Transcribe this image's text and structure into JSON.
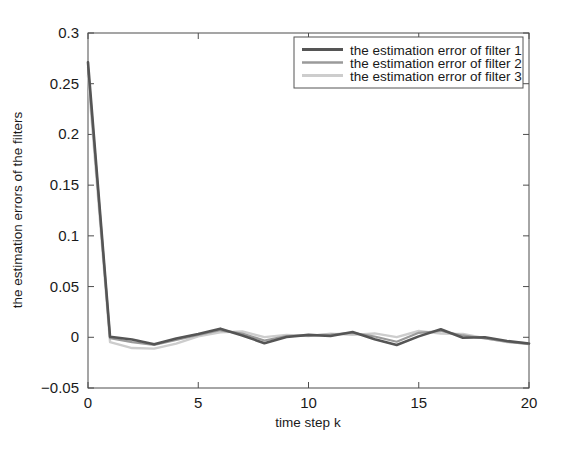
{
  "chart_data": {
    "type": "line",
    "title": "",
    "xlabel": "time step k",
    "ylabel": "the estimation errors of the filters",
    "xlim": [
      0,
      20
    ],
    "ylim": [
      -0.05,
      0.3
    ],
    "xticks": [
      0,
      5,
      10,
      15,
      20
    ],
    "yticks": [
      -0.05,
      0,
      0.05,
      0.1,
      0.15,
      0.2,
      0.25,
      0.3
    ],
    "xtick_labels": [
      "0",
      "5",
      "10",
      "15",
      "20"
    ],
    "ytick_labels": [
      "-0.05",
      "0",
      "0.05",
      "0.1",
      "0.15",
      "0.2",
      "0.25",
      "0.3"
    ],
    "grid": false,
    "legend_position": "top-right",
    "x": [
      0,
      1,
      2,
      3,
      4,
      5,
      6,
      7,
      8,
      9,
      10,
      11,
      12,
      13,
      14,
      15,
      16,
      17,
      18,
      19,
      20
    ],
    "series": [
      {
        "name": "the estimation error of filter 1",
        "color": "#555555",
        "width": 2.6,
        "values": [
          0.271,
          0.0005,
          -0.0022,
          -0.0068,
          -0.0012,
          0.0032,
          0.0085,
          0.0018,
          -0.0058,
          0.0003,
          0.0024,
          0.0012,
          0.0052,
          -0.0019,
          -0.0076,
          0.0009,
          0.0079,
          -0.0004,
          0.0001,
          -0.0037,
          -0.0062
        ]
      },
      {
        "name": "the estimation error of filter 2",
        "color": "#9a9a9a",
        "width": 2.2,
        "values": [
          0.266,
          -0.0008,
          -0.0048,
          -0.0075,
          -0.0026,
          0.0022,
          0.0069,
          0.0036,
          -0.0032,
          0.0012,
          0.0018,
          0.0026,
          0.0044,
          0.0008,
          -0.0044,
          0.0044,
          0.0062,
          0.0018,
          -0.0012,
          -0.0044,
          -0.0068
        ]
      },
      {
        "name": "the estimation error of filter 3",
        "color": "#cdcdcd",
        "width": 2.4,
        "values": [
          0.258,
          -0.0048,
          -0.0106,
          -0.0112,
          -0.0062,
          0.0009,
          0.0048,
          0.0058,
          0.0002,
          0.0024,
          0.0012,
          0.0036,
          0.0024,
          0.0038,
          0.0002,
          0.0062,
          0.0036,
          0.0032,
          -0.0008,
          -0.0046,
          -0.0062
        ]
      }
    ]
  },
  "legend": {
    "entries": [
      {
        "label": "the estimation error of filter 1"
      },
      {
        "label": "the estimation error of filter 2"
      },
      {
        "label": "the estimation error of filter 3"
      }
    ]
  },
  "axes": {
    "x_title": "time step k",
    "y_title": "the estimation errors of the filters"
  },
  "colors": {
    "axis": "#4d4d4d",
    "background": "#ffffff",
    "series1": "#555555",
    "series2": "#9a9a9a",
    "series3": "#cdcdcd",
    "legend_border": "#555555"
  }
}
